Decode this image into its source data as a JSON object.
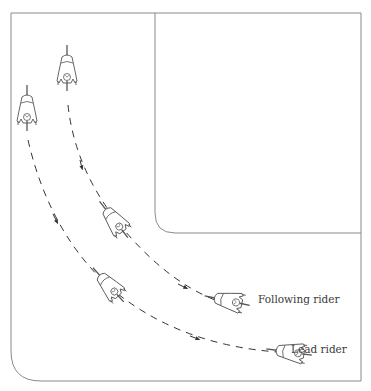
{
  "diagram": {
    "title": "",
    "colors": {
      "frame": "#8a8a8a",
      "rider": "#555555",
      "path": "#333333",
      "text": "#3a3a3a"
    },
    "labels": {
      "following_rider": "Following rider",
      "lead_rider": "Lead rider"
    },
    "riders": [
      {
        "name": "following-rider-start",
        "x": 67,
        "y": 72,
        "angle": 0
      },
      {
        "name": "following-rider-mid",
        "x": 118,
        "y": 225,
        "angle": -38
      },
      {
        "name": "following-rider-end",
        "x": 232,
        "y": 302,
        "angle": -80
      },
      {
        "name": "lead-rider-start",
        "x": 27,
        "y": 110,
        "angle": 0
      },
      {
        "name": "lead-rider-mid",
        "x": 113,
        "y": 290,
        "angle": -40
      },
      {
        "name": "lead-rider-end",
        "x": 295,
        "y": 352,
        "angle": -82
      }
    ]
  }
}
